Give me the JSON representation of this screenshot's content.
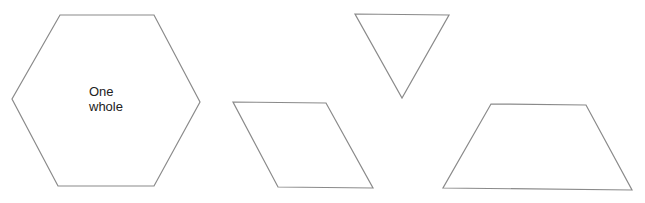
{
  "diagram": {
    "shapes": [
      {
        "id": "hexagon",
        "type": "hexagon",
        "label_lines": [
          "One",
          "whole"
        ],
        "points": "60,15 154,15 200,102 154,186 58,186 12,99"
      },
      {
        "id": "triangle",
        "type": "triangle",
        "label_lines": [],
        "points": "355,14 449,15 402,98"
      },
      {
        "id": "rhombus",
        "type": "rhombus",
        "label_lines": [],
        "points": "233,102 326,103 373,188 278,187"
      },
      {
        "id": "trapezoid",
        "type": "trapezoid",
        "label_lines": [],
        "points": "491,104 586,105 632,190 443,188"
      }
    ],
    "stroke_color": "#8a8a8a",
    "fill_color": "#ffffff"
  }
}
